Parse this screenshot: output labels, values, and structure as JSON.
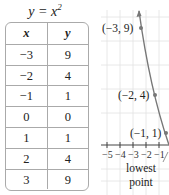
{
  "table": {
    "title": "y = x",
    "title_exponent": "2",
    "headers": [
      "x",
      "y"
    ],
    "rows": [
      [
        "−3",
        "9"
      ],
      [
        "−2",
        "4"
      ],
      [
        "−1",
        "1"
      ],
      [
        "0",
        "0"
      ],
      [
        "1",
        "1"
      ],
      [
        "2",
        "4"
      ],
      [
        "3",
        "9"
      ]
    ]
  },
  "graph": {
    "points": [
      {
        "label": "(−3, 9)"
      },
      {
        "label": "(−2, 4)"
      },
      {
        "label": "(−1, 1)"
      }
    ],
    "x_ticks": [
      "−5",
      "−4",
      "−3",
      "−2",
      "−1"
    ],
    "annotation_line1": "lowest",
    "annotation_line2": "point",
    "colors": {
      "curve": "#777777",
      "grid": "#e2e2e2",
      "axis": "#444444"
    }
  }
}
